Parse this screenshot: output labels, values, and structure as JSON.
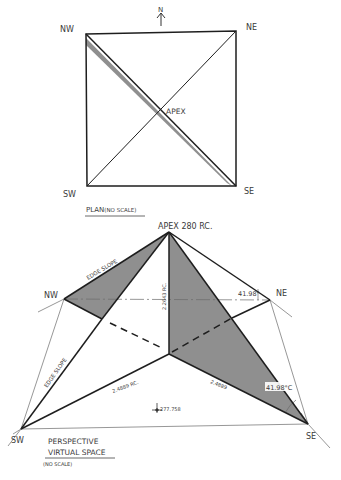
{
  "plan": {
    "north_label": "N",
    "corners": {
      "nw": "NW",
      "ne": "NE",
      "sw": "SW",
      "se": "SE"
    },
    "apex_label": "APEX",
    "caption": "PLAN",
    "caption_note": "(NO SCALE)"
  },
  "perspective": {
    "apex_label": "APEX 280 RC.",
    "corners": {
      "nw": "NW",
      "ne": "NE",
      "sw": "SW",
      "se": "SE"
    },
    "edge_slope_upper": "EDGE SLOPE",
    "edge_slope_lower": "EDGE SLOPE",
    "height_dim": "2.2643 RC.",
    "base_dim_left": "2.4889 RC.",
    "base_dim_right": "2.4889",
    "angle_ne": "41.98°",
    "angle_se": "41.98°C",
    "level_mark": "277.758",
    "caption_line1": "PERSPECTIVE",
    "caption_line2": "VIRTUAL SPACE",
    "caption_note": "(NO SCALE)"
  },
  "colors": {
    "line": "#1e1e1e",
    "shade": "#8f8f8f",
    "thin": "#6a6a6a"
  }
}
